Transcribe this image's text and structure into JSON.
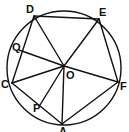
{
  "diagram": {
    "type": "geometry",
    "circle": {
      "cx": 64,
      "cy": 68,
      "r": 57
    },
    "points": {
      "D": {
        "label": "D",
        "x": 34,
        "y": 16,
        "lx": 26,
        "ly": 13
      },
      "E": {
        "label": "E",
        "x": 99,
        "y": 19,
        "lx": 99,
        "ly": 16
      },
      "F": {
        "label": "F",
        "x": 118,
        "y": 82,
        "lx": 120,
        "ly": 90
      },
      "A": {
        "label": "A",
        "x": 62,
        "y": 124,
        "lx": 59,
        "ly": 135
      },
      "C": {
        "label": "C",
        "x": 12,
        "y": 83,
        "lx": 1,
        "ly": 88
      },
      "Q": {
        "label": "Q",
        "x": 19,
        "y": 50,
        "lx": 12,
        "ly": 51
      },
      "P": {
        "label": "P",
        "x": 40,
        "y": 105,
        "lx": 33,
        "ly": 112
      },
      "O": {
        "label": "O",
        "x": 64,
        "y": 66,
        "lx": 66,
        "ly": 79
      }
    },
    "segments": [
      [
        "D",
        "E"
      ],
      [
        "E",
        "F"
      ],
      [
        "F",
        "A"
      ],
      [
        "A",
        "C"
      ],
      [
        "C",
        "D"
      ],
      [
        "D",
        "O"
      ],
      [
        "E",
        "O"
      ],
      [
        "F",
        "O"
      ],
      [
        "A",
        "O"
      ],
      [
        "C",
        "O"
      ],
      [
        "Q",
        "O"
      ],
      [
        "P",
        "O"
      ]
    ],
    "labels": [
      "D",
      "E",
      "F",
      "A",
      "C",
      "Q",
      "P",
      "O"
    ]
  }
}
